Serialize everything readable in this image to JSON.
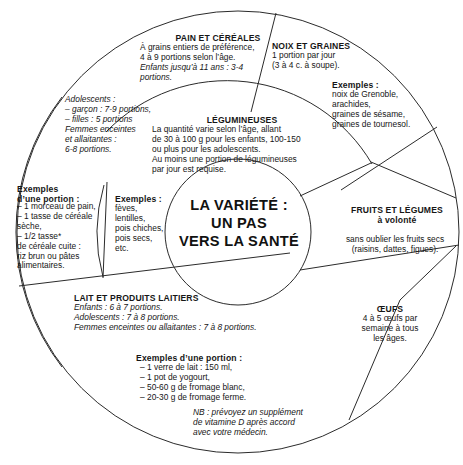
{
  "diagram": {
    "type": "food-guide-wheel",
    "center_title": "LA VARIÉTÉ :\nUN PAS\nVERS LA SANTÉ",
    "stroke_color": "#2b2b2b",
    "background_color": "#ffffff",
    "text_color": "#161616"
  },
  "sectors": {
    "pain_cereales": {
      "heading": "PAIN ET CÉRÉALES",
      "body_1": "À grains entiers de préférence,\n4 à 9 portions selon l’âge.",
      "body_2": "Enfants jusqu’à 11 ans : 3-4\nportions.",
      "adolescents": "Adolescents :\n– garçon : 7-9 portions,\n– filles : 5 portions\nFemmes enceintes\net allaitantes :\n6-8 portions.",
      "examples_heading": "Exemples\nd’une portion :",
      "examples_body": "– 1 morceau de pain,\n– 1 tasse de céréale\nsèche,\n– 1/2 tasse*\nde céréale cuite :\nriz brun ou pâtes\nalimentaires."
    },
    "noix_graines": {
      "heading": "NOIX ET GRAINES",
      "body": "1 portion par jour\n(3 à 4 c. à soupe).",
      "examples_heading": "Exemples :",
      "examples_body": "noix de Grenoble,\narachides,\ngraines de sésame,\ngraines de tournesol."
    },
    "legumineuses": {
      "heading": "LÉGUMINEUSES",
      "body": "La quantité varie selon l’âge, allant\nde 30 à 100 g pour les enfants, 100-150\nou plus pour les adolescents.\nAu moins une portion de légumineuses\npar jour est requise.",
      "examples_heading": "Exemples :",
      "examples_body": "fèves,\nlentilles,\npois chiches,\npois secs,\netc."
    },
    "fruits_legumes": {
      "heading": "FRUITS ET LÉGUMES\nà volonté",
      "body": "sans oublier les fruits secs\n(raisins, dattes, figues)."
    },
    "oeufs": {
      "heading": "ŒUFS",
      "body": "4 à 5 œufs par\nsemaine à tous\nles âges."
    },
    "lait_produits_laitiers": {
      "heading": "LAIT ET PRODUITS LAITIERS",
      "body": "Enfants : 6 à 7 portions.\nAdolescents : 7 à 8 portions.\nFemmes enceintes ou allaitantes : 7 à 8 portions.",
      "examples_heading": "Exemples d’une portion :",
      "examples_body": "– 1 verre de lait : 150 ml,\n– 1 pot de yogourt,\n– 50-60 g de fromage blanc,\n– 20-30 g de fromage ferme."
    },
    "note": {
      "text": "NB : prévoyez un supplément\nde vitamine D après accord\navec votre médecin."
    }
  }
}
